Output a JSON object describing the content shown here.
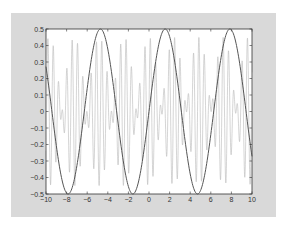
{
  "chart_data": {
    "type": "line",
    "title": "",
    "xlabel": "",
    "ylabel": "",
    "xlim": [
      -10,
      10
    ],
    "ylim": [
      -0.5,
      0.5
    ],
    "grid": false,
    "legend": null,
    "xticks": [
      -10,
      -8,
      -6,
      -4,
      -2,
      0,
      2,
      4,
      6,
      8,
      10
    ],
    "xtick_labels": [
      "-10",
      "-8",
      "-6",
      "-4",
      "-2",
      "0",
      "2",
      "4",
      "6",
      "8",
      "10"
    ],
    "yticks": [
      -0.5,
      -0.4,
      -0.3,
      -0.2,
      -0.1,
      0,
      0.1,
      0.2,
      0.3,
      0.4,
      0.5
    ],
    "ytick_labels": [
      "-0.5",
      "-0.4",
      "-0.3",
      "-0.2",
      "-0.1",
      "0",
      "0.1",
      "0.2",
      "0.3",
      "0.4",
      "0.5"
    ],
    "series": [
      {
        "name": "slow sinusoid",
        "formula": "0.5*sin(x)",
        "color": "#555555",
        "line_width": 1,
        "x": [
          -10,
          -9,
          -8,
          -7.85,
          -7,
          -6,
          -5,
          -4.71,
          -4,
          -3,
          -2,
          -1.57,
          -1,
          0,
          1,
          1.57,
          2,
          3,
          4,
          4.71,
          5,
          6,
          7,
          7.85,
          8,
          9,
          10
        ],
        "values": [
          0.27,
          -0.21,
          -0.49,
          -0.5,
          -0.33,
          0.14,
          0.48,
          0.5,
          0.38,
          -0.07,
          -0.45,
          -0.5,
          -0.42,
          0,
          0.42,
          0.5,
          0.45,
          0.07,
          -0.38,
          -0.5,
          -0.48,
          -0.14,
          0.33,
          0.5,
          0.49,
          0.21,
          -0.27
        ]
      },
      {
        "name": "fast oscillation",
        "formula": "approx 0.45*cos(1.3*x)*sin(12*x)",
        "color": "#b8b8b8",
        "line_width": 0.6,
        "envelope_max": 0.45
      }
    ]
  },
  "figure": {
    "background": "#d9d9d9",
    "axes_background": "#ffffff",
    "axes_color": "#333333"
  },
  "caption": ""
}
